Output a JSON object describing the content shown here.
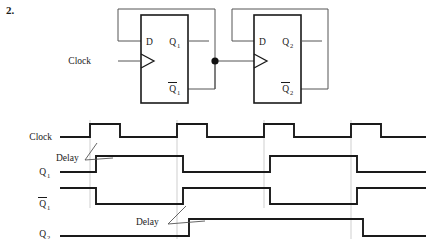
{
  "problem": {
    "number": "2."
  },
  "circuit": {
    "clock_label": "Clock",
    "ff1": {
      "d_label": "D",
      "q_label": "Q",
      "q_sub": "1",
      "qbar_label": "Q",
      "qbar_sub": "1"
    },
    "ff2": {
      "d_label": "D",
      "q_label": "Q",
      "q_sub": "2",
      "qbar_label": "Q",
      "qbar_sub": "2"
    },
    "junction_dot": "wire-junction"
  },
  "timing": {
    "annotations": [
      {
        "text": "Delay",
        "x": 56,
        "y": 158
      },
      {
        "text": "Delay",
        "x": 136,
        "y": 222
      }
    ],
    "signals": [
      {
        "name": "Clock",
        "label": "Clock",
        "sub": "",
        "baseline": 137,
        "high": 124,
        "low": 137
      },
      {
        "name": "Q1",
        "label": "Q",
        "sub": "1",
        "bar": false,
        "baseline": 172,
        "high": 156,
        "low": 172
      },
      {
        "name": "Q1bar",
        "label": "Q",
        "sub": "1",
        "bar": true,
        "baseline": 204,
        "high": 188,
        "low": 204
      },
      {
        "name": "Q2",
        "label": "Q",
        "sub": "2",
        "bar": false,
        "baseline": 236,
        "high": 219,
        "low": 236
      }
    ]
  },
  "chart_data": {
    "type": "line",
    "title": "",
    "xlabel": "",
    "ylabel": "",
    "xlim": [
      60,
      426
    ],
    "grid": false,
    "legend": "none",
    "clock_period_px": 87,
    "delay_px": 6,
    "series": [
      {
        "name": "Clock",
        "label": "Clock",
        "levels": "0 1 0 1 0 1 0 1 0",
        "transitions_x": [
          90,
          120,
          177,
          207,
          264,
          294,
          351,
          381
        ],
        "values": [
          0,
          1,
          0,
          1,
          0,
          1,
          0,
          1,
          0
        ]
      },
      {
        "name": "Q1",
        "label": "Q1",
        "levels": "0 1 0 1 0",
        "transitions_x": [
          96,
          183,
          270,
          357
        ],
        "values": [
          0,
          1,
          0,
          1,
          0
        ]
      },
      {
        "name": "Q1bar",
        "label": "Q1bar",
        "levels": "1 0 1 0 1",
        "transitions_x": [
          96,
          183,
          270,
          357
        ],
        "values": [
          1,
          0,
          1,
          0,
          1
        ]
      },
      {
        "name": "Q2",
        "label": "Q2",
        "levels": "0 1 0",
        "transitions_x": [
          189,
          363
        ],
        "values": [
          0,
          1,
          0
        ]
      }
    ]
  }
}
